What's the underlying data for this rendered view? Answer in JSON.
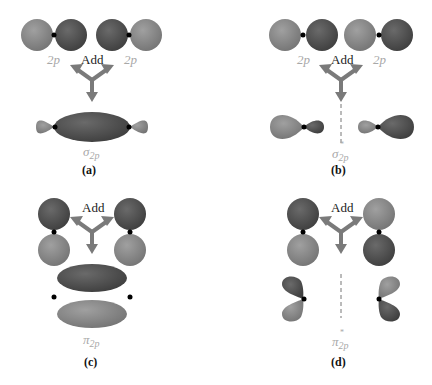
{
  "panels": {
    "a": {
      "left_orbital": "2p",
      "right_orbital": "2p",
      "operation": "Add",
      "result_symbol": "σ",
      "result_subscript": "2p",
      "caption": "(a)"
    },
    "b": {
      "left_orbital": "2p",
      "right_orbital": "2p",
      "operation": "Add",
      "result_symbol": "σ",
      "result_subscript": "2p",
      "result_superscript": "*",
      "caption": "(b)"
    },
    "c": {
      "operation": "Add",
      "result_symbol": "π",
      "result_subscript": "2p",
      "caption": "(c)"
    },
    "d": {
      "operation": "Add",
      "result_symbol": "π",
      "result_subscript": "2p",
      "result_superscript": "*",
      "caption": "(d)"
    }
  },
  "colors": {
    "dark_lobe": "#555555",
    "light_lobe": "#8c8c8c",
    "arrow": "#7a7a7a",
    "label_gray": "#a8a8a8",
    "nucleus": "#000000"
  }
}
